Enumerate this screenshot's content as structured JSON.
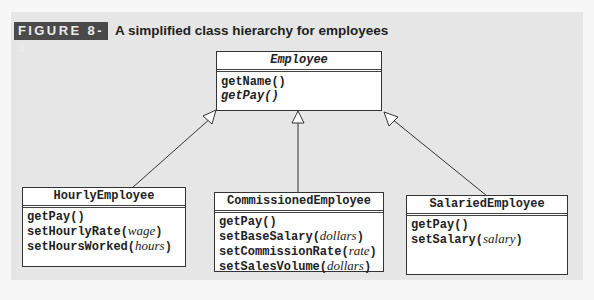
{
  "figure": {
    "label": "FIGURE 8-4",
    "title": "A simplified class hierarchy for employees"
  },
  "colors": {
    "panel": "#e6e6e6",
    "badge": "#4a4a4a",
    "box": "#ffffff",
    "line": "#333333"
  },
  "classes": {
    "employee": {
      "name": "Employee",
      "abstract": true,
      "methods": [
        {
          "name": "getName()",
          "abstract": false
        },
        {
          "name": "getPay()",
          "abstract": true
        }
      ]
    },
    "hourly": {
      "name": "HourlyEmployee",
      "methods": [
        {
          "name": "getPay()",
          "param": ""
        },
        {
          "name": "setHourlyRate",
          "param": "wage"
        },
        {
          "name": "setHoursWorked",
          "param": "hours"
        }
      ]
    },
    "commissioned": {
      "name": "CommissionedEmployee",
      "methods": [
        {
          "name": "getPay()",
          "param": ""
        },
        {
          "name": "setBaseSalary",
          "param": "dollars"
        },
        {
          "name": "setCommissionRate",
          "param": "rate"
        },
        {
          "name": "setSalesVolume",
          "param": "dollars"
        }
      ]
    },
    "salaried": {
      "name": "SalariedEmployee",
      "methods": [
        {
          "name": "getPay()",
          "param": ""
        },
        {
          "name": "setSalary",
          "param": "salary"
        }
      ]
    }
  },
  "punct": {
    "open": "(",
    "close": ")"
  }
}
